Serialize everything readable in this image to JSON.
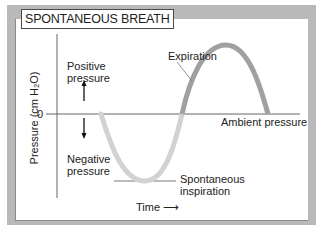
{
  "diagram": {
    "title": "SPONTANEOUS BREATH",
    "y_axis_label": "Pressure (cm H₂O)",
    "zero_tick": "0",
    "x_axis_label": "Time",
    "x_axis_arrow": "⟶",
    "labels": {
      "positive": [
        "Positive",
        "pressure"
      ],
      "negative": [
        "Negative",
        "pressure"
      ],
      "ambient": "Ambient pressure",
      "expiration": "Expiration",
      "inspiration": [
        "Spontaneous",
        "inspiration"
      ]
    },
    "colors": {
      "frame": "#b9b9b9",
      "inspiration_curve": "#d0d0d0",
      "expiration_curve": "#9a9a9a",
      "axis": "#555555"
    }
  }
}
